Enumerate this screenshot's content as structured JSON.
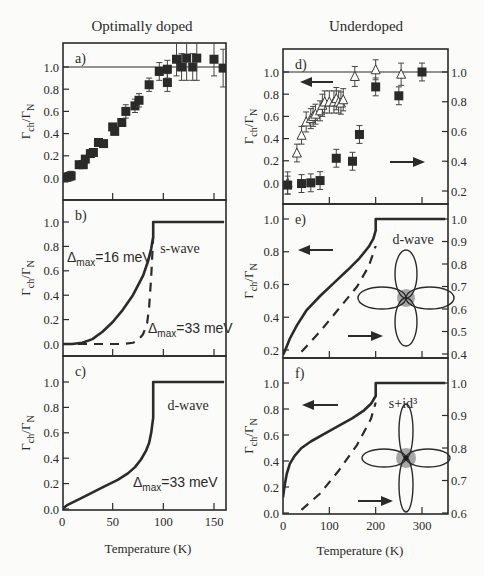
{
  "figure": {
    "column_titles": [
      "Optimally doped",
      "Underdoped"
    ],
    "ylabel_main": "Γ",
    "ylabel_sub1": "ch",
    "ylabel_mid": "/Γ",
    "ylabel_sub2": "N",
    "xlabel": "Temperature (K)"
  },
  "chart_data": [
    {
      "id": "a",
      "panel_label": "a)",
      "type": "scatter",
      "title": "Optimally doped",
      "xlabel": "Temperature (K)",
      "ylabel": "Γch/ΓN",
      "xlim": [
        0,
        160
      ],
      "ylim": [
        -0.1,
        1.2
      ],
      "xticks": [
        0,
        50,
        100,
        150
      ],
      "yticks": [
        0.0,
        0.2,
        0.4,
        0.6,
        0.8,
        1.0
      ],
      "reference_line": 1.0,
      "series": [
        {
          "name": "data",
          "marker": "filled-square",
          "x": [
            2,
            6,
            9,
            17,
            21,
            23,
            28,
            31,
            36,
            41,
            50,
            52,
            59,
            63,
            72,
            76,
            86,
            96,
            104,
            104,
            113,
            118,
            123,
            129,
            133,
            150,
            159
          ],
          "y": [
            0.0,
            0.01,
            0.02,
            0.12,
            0.12,
            0.17,
            0.22,
            0.23,
            0.32,
            0.31,
            0.46,
            0.42,
            0.5,
            0.6,
            0.65,
            0.7,
            0.84,
            0.96,
            0.86,
            0.98,
            1.07,
            1.0,
            1.08,
            1.0,
            1.08,
            1.07,
            0.99
          ],
          "yerr": [
            0.03,
            0.04,
            0.04,
            0.02,
            0.02,
            0.02,
            0.02,
            0.02,
            0.02,
            0.02,
            0.02,
            0.02,
            0.03,
            0.06,
            0.06,
            0.06,
            0.06,
            0.08,
            0.08,
            0.08,
            0.15,
            0.12,
            0.2,
            0.12,
            0.2,
            0.15,
            0.17
          ]
        }
      ]
    },
    {
      "id": "b",
      "panel_label": "b)",
      "type": "line",
      "xlim": [
        0,
        160
      ],
      "ylim": [
        -0.05,
        1.15
      ],
      "xticks": [
        0,
        50,
        100,
        150
      ],
      "yticks": [
        0.0,
        0.2,
        0.4,
        0.6,
        0.8,
        1.0
      ],
      "annotations": [
        "s-wave",
        "Δmax=16 meV",
        "Δmax=33 meV"
      ],
      "series": [
        {
          "name": "Δmax=16 meV",
          "style": "solid",
          "x": [
            0,
            10,
            20,
            30,
            40,
            50,
            60,
            70,
            75,
            80,
            85,
            88,
            90,
            90,
            160
          ],
          "y": [
            0.0,
            0.0,
            0.01,
            0.04,
            0.1,
            0.18,
            0.28,
            0.4,
            0.48,
            0.56,
            0.68,
            0.78,
            0.88,
            1.0,
            1.0
          ]
        },
        {
          "name": "Δmax=33 meV",
          "style": "dashed",
          "x": [
            0,
            20,
            40,
            60,
            70,
            75,
            80,
            84,
            86,
            88,
            90
          ],
          "y": [
            0.0,
            0.0,
            0.0,
            0.0,
            0.01,
            0.03,
            0.08,
            0.17,
            0.3,
            0.55,
            0.88
          ]
        }
      ]
    },
    {
      "id": "c",
      "panel_label": "c)",
      "type": "line",
      "xlim": [
        0,
        160
      ],
      "ylim": [
        0,
        1.15
      ],
      "xticks": [
        0,
        50,
        100,
        150
      ],
      "yticks": [
        0.0,
        0.2,
        0.4,
        0.6,
        0.8,
        1.0
      ],
      "annotations": [
        "d-wave",
        "Δmax=33 meV"
      ],
      "series": [
        {
          "name": "Δmax=33 meV",
          "style": "solid",
          "x": [
            0,
            5,
            20,
            40,
            55,
            65,
            72,
            78,
            83,
            86,
            88,
            90,
            90,
            160
          ],
          "y": [
            0.0,
            0.03,
            0.09,
            0.17,
            0.23,
            0.28,
            0.33,
            0.39,
            0.46,
            0.52,
            0.6,
            0.72,
            1.0,
            1.0
          ]
        }
      ]
    },
    {
      "id": "d",
      "panel_label": "d)",
      "type": "scatter",
      "title": "Underdoped",
      "xlim": [
        0,
        350
      ],
      "ylim": [
        -0.08,
        1.15
      ],
      "y2lim": [
        0.12,
        1.08
      ],
      "xticks": [
        0,
        100,
        200,
        300
      ],
      "yticks": [
        0.0,
        0.2,
        0.4,
        0.6,
        0.8,
        1.0
      ],
      "y2ticks": [
        0.2,
        0.4,
        0.6,
        0.8,
        1.0
      ],
      "reference_line": 1.0,
      "arrows": [
        "left-axis (triangles)",
        "right-axis (squares)"
      ],
      "series": [
        {
          "name": "left axis",
          "marker": "open-triangle",
          "axis": "left",
          "x": [
            10,
            30,
            40,
            50,
            60,
            65,
            70,
            80,
            85,
            90,
            100,
            110,
            115,
            120,
            125,
            130,
            155,
            200,
            255
          ],
          "y": [
            0.0,
            0.27,
            0.43,
            0.55,
            0.58,
            0.6,
            0.62,
            0.65,
            0.7,
            0.73,
            0.73,
            0.73,
            0.76,
            0.73,
            0.72,
            0.75,
            0.96,
            1.02,
            0.98
          ],
          "yerr": [
            0.1,
            0.08,
            0.08,
            0.09,
            0.09,
            0.09,
            0.09,
            0.09,
            0.1,
            0.1,
            0.1,
            0.1,
            0.1,
            0.1,
            0.1,
            0.1,
            0.09,
            0.09,
            0.1
          ]
        },
        {
          "name": "right axis",
          "marker": "filled-square",
          "axis": "right",
          "x": [
            10,
            40,
            60,
            80,
            115,
            150,
            165,
            200,
            250,
            300
          ],
          "y2": [
            0.24,
            0.25,
            0.255,
            0.27,
            0.42,
            0.4,
            0.58,
            0.9,
            0.84,
            1.0
          ],
          "yerr": [
            0.06,
            0.06,
            0.06,
            0.06,
            0.06,
            0.06,
            0.06,
            0.06,
            0.06,
            0.06
          ]
        }
      ]
    },
    {
      "id": "e",
      "panel_label": "e)",
      "type": "line",
      "xlim": [
        0,
        350
      ],
      "ylim": [
        0.15,
        1.08
      ],
      "y2lim": [
        0.38,
        1.05
      ],
      "xticks": [
        0,
        100,
        200,
        300
      ],
      "yticks": [
        0.2,
        0.4,
        0.6,
        0.8,
        1.0
      ],
      "y2ticks": [
        0.4,
        0.5,
        0.6,
        0.7,
        0.8,
        0.9,
        1.0
      ],
      "annotations": [
        "d-wave"
      ],
      "inset": "d-wave gap (four-lobe clover)",
      "series": [
        {
          "name": "left axis",
          "style": "solid",
          "axis": "left",
          "x": [
            0,
            5,
            15,
            30,
            50,
            80,
            110,
            140,
            165,
            185,
            195,
            200,
            200,
            350
          ],
          "y": [
            0.17,
            0.2,
            0.27,
            0.35,
            0.44,
            0.53,
            0.61,
            0.69,
            0.76,
            0.83,
            0.88,
            0.93,
            1.0,
            1.0
          ]
        },
        {
          "name": "right axis",
          "style": "dashed",
          "axis": "right",
          "x": [
            40,
            80,
            120,
            160,
            185,
            200
          ],
          "y2": [
            0.41,
            0.5,
            0.6,
            0.7,
            0.79,
            0.88
          ]
        }
      ]
    },
    {
      "id": "f",
      "panel_label": "f)",
      "type": "line",
      "xlim": [
        0,
        350
      ],
      "ylim": [
        0,
        1.18
      ],
      "y2lim": [
        0.6,
        1.05
      ],
      "xticks": [
        0,
        100,
        200,
        300
      ],
      "yticks": [
        0.0,
        0.2,
        0.4,
        0.6,
        0.8,
        1.0
      ],
      "y2ticks": [
        0.6,
        0.7,
        0.8,
        0.9,
        1.0
      ],
      "annotations": [
        "s+id³"
      ],
      "inset": "s+id gap (four-lobe with central point)",
      "series": [
        {
          "name": "left axis",
          "style": "solid",
          "axis": "left",
          "x": [
            0,
            3,
            8,
            15,
            25,
            40,
            60,
            90,
            120,
            150,
            175,
            190,
            200,
            200,
            350
          ],
          "y": [
            0.12,
            0.2,
            0.3,
            0.38,
            0.44,
            0.5,
            0.55,
            0.61,
            0.67,
            0.73,
            0.79,
            0.84,
            0.9,
            1.0,
            1.0
          ]
        },
        {
          "name": "right axis",
          "style": "dashed",
          "axis": "right",
          "x": [
            40,
            80,
            120,
            160,
            190,
            200
          ],
          "y2": [
            0.61,
            0.66,
            0.73,
            0.81,
            0.89,
            0.94
          ]
        }
      ]
    }
  ]
}
